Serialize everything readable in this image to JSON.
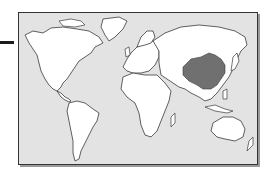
{
  "map": {
    "type": "world-locator-map",
    "highlighted_region": "China",
    "colors": {
      "ocean": "#e3e3e3",
      "land": "#ffffff",
      "highlight": "#707070",
      "outline": "#3a3a3a",
      "pointer": "#1a1a1a"
    },
    "regions": [
      "North America",
      "Greenland",
      "South America",
      "Europe",
      "Africa",
      "Asia",
      "Australia"
    ]
  }
}
